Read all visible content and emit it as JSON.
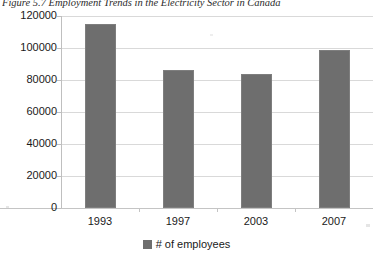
{
  "figure": {
    "caption": "Figure 5.7 Employment Trends in the Electricity Sector in Canada"
  },
  "chart_data": {
    "type": "bar",
    "title": "Figure 5.7 Employment Trends in the Electricity Sector in Canada",
    "categories": [
      "1993",
      "1997",
      "2003",
      "2007"
    ],
    "values": [
      115000,
      86500,
      84000,
      98500
    ],
    "series": [
      {
        "name": "# of employees",
        "values": [
          115000,
          86500,
          84000,
          98500
        ]
      }
    ],
    "xlabel": "",
    "ylabel": "",
    "ylim": [
      0,
      120000
    ],
    "ytick_labels": [
      "0",
      "20000",
      "40000",
      "60000",
      "80000",
      "100000",
      "120000"
    ],
    "ytick_values": [
      0,
      20000,
      40000,
      60000,
      80000,
      100000,
      120000
    ],
    "grid": true,
    "legend": {
      "position": "bottom",
      "entries": [
        "# of employees"
      ]
    },
    "bar_color": "#6e6e6e",
    "grid_color": "#d9d9d9",
    "axis_color": "#bfbfbf"
  }
}
